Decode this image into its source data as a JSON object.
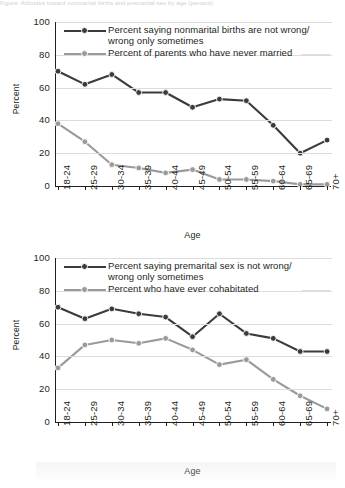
{
  "page": {
    "top_caption": "Figure: Attitudes toward nonmarital births and premarital sex by age (percent)"
  },
  "colors": {
    "series_dark": "#3b3b3d",
    "series_light": "#9a9a9c",
    "axis": "#231f20",
    "grid": "#dcdcde",
    "background": "#ffffff"
  },
  "charts": [
    {
      "id": "chart-nonmarital-births",
      "ylabel": "Percent",
      "xlabel": "Age",
      "yticks": [
        "100",
        "80",
        "60",
        "40",
        "20",
        "0"
      ],
      "legend": [
        {
          "label": "Percent saying nonmarital births are not wrong/\nwrong only sometimes",
          "color_key": "series_dark"
        },
        {
          "label": "Percent of parents who have never married",
          "color_key": "series_light"
        }
      ]
    },
    {
      "id": "chart-premarital-sex",
      "ylabel": "Percent",
      "xlabel": "Age",
      "yticks": [
        "100",
        "80",
        "60",
        "40",
        "20",
        "0"
      ],
      "legend": [
        {
          "label": "Percent saying premarital sex is not wrong/\nwrong only sometimes",
          "color_key": "series_dark"
        },
        {
          "label": "Percent who have ever cohabitated",
          "color_key": "series_light"
        }
      ]
    }
  ],
  "chart_data": [
    {
      "type": "line",
      "title": "",
      "xlabel": "Age",
      "ylabel": "Percent",
      "ylim": [
        0,
        100
      ],
      "yticks": [
        0,
        20,
        40,
        60,
        80,
        100
      ],
      "grid": true,
      "legend_position": "top-left inside",
      "categories": [
        "18-24",
        "25-29",
        "30-34",
        "35-39",
        "40-44",
        "45-49",
        "50-54",
        "55-59",
        "60-64",
        "65-69",
        "70+"
      ],
      "series": [
        {
          "name": "Percent saying nonmarital births are not wrong/wrong only sometimes",
          "color": "#3b3b3d",
          "values": [
            70,
            62,
            68,
            57,
            57,
            48,
            53,
            52,
            37,
            20,
            28
          ]
        },
        {
          "name": "Percent of parents who have never married",
          "color": "#9a9a9c",
          "values": [
            38,
            27,
            13,
            11,
            8,
            10,
            4,
            4,
            3,
            1,
            1
          ]
        }
      ]
    },
    {
      "type": "line",
      "title": "",
      "xlabel": "Age",
      "ylabel": "Percent",
      "ylim": [
        0,
        100
      ],
      "yticks": [
        0,
        20,
        40,
        60,
        80,
        100
      ],
      "grid": true,
      "legend_position": "top-left inside",
      "categories": [
        "18-24",
        "25-29",
        "30-34",
        "35-39",
        "40-44",
        "45-49",
        "50-54",
        "55-59",
        "60-64",
        "65-69",
        "70+"
      ],
      "series": [
        {
          "name": "Percent saying premarital sex is not wrong/wrong only sometimes",
          "color": "#3b3b3d",
          "values": [
            70,
            63,
            69,
            66,
            64,
            52,
            66,
            54,
            51,
            43,
            43
          ]
        },
        {
          "name": "Percent who have ever cohabitated",
          "color": "#9a9a9c",
          "values": [
            33,
            47,
            50,
            48,
            51,
            44,
            35,
            38,
            26,
            16,
            8
          ]
        }
      ]
    }
  ]
}
